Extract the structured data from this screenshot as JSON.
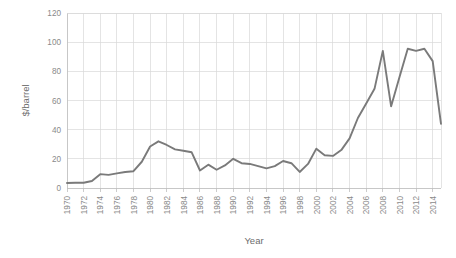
{
  "chart_data": {
    "type": "line",
    "title": "",
    "xlabel": "Year",
    "ylabel": "$/barrel",
    "xlim": [
      1970,
      2015
    ],
    "ylim": [
      0,
      120
    ],
    "grid": true,
    "legend": "none",
    "line_color": "#7a7a7a",
    "grid_color": "#d9d9d9",
    "axis_color": "#bfbfbf",
    "text_color": "#8a8a8a",
    "ytick_labels": [
      "0",
      "20",
      "40",
      "60",
      "80",
      "100",
      "120"
    ],
    "ytick_values": [
      0,
      20,
      40,
      60,
      80,
      100,
      120
    ],
    "xtick_labels": [
      "1970",
      "1972",
      "1974",
      "1976",
      "1978",
      "1980",
      "1982",
      "1984",
      "1986",
      "1988",
      "1990",
      "1992",
      "1994",
      "1996",
      "1998",
      "2000",
      "2002",
      "2004",
      "2006",
      "2008",
      "2010",
      "2012",
      "2014"
    ],
    "xtick_values": [
      1970,
      1972,
      1974,
      1976,
      1978,
      1980,
      1982,
      1984,
      1986,
      1988,
      1990,
      1992,
      1994,
      1996,
      1998,
      2000,
      2002,
      2004,
      2006,
      2008,
      2010,
      2012,
      2014
    ],
    "series": [
      {
        "name": "Crude oil price",
        "x": [
          1970,
          1971,
          1972,
          1973,
          1974,
          1975,
          1976,
          1977,
          1978,
          1979,
          1980,
          1981,
          1982,
          1983,
          1984,
          1985,
          1986,
          1987,
          1988,
          1989,
          1990,
          1991,
          1992,
          1993,
          1994,
          1995,
          1996,
          1997,
          1998,
          1999,
          2000,
          2001,
          2002,
          2003,
          2004,
          2005,
          2006,
          2007,
          2008,
          2009,
          2010,
          2011,
          2012,
          2013,
          2014,
          2015
        ],
        "values": [
          3.4,
          3.6,
          3.6,
          4.8,
          9.5,
          9.0,
          10.0,
          11.0,
          11.5,
          18.0,
          28.5,
          32.0,
          29.5,
          26.5,
          25.5,
          24.5,
          12.0,
          16.0,
          12.5,
          15.5,
          20.0,
          17.0,
          16.5,
          15.0,
          13.5,
          15.0,
          18.5,
          17.0,
          11.0,
          16.5,
          27.0,
          22.5,
          22.0,
          26.0,
          34.0,
          48.0,
          58.0,
          68.0,
          94.0,
          56.0,
          76.0,
          95.5,
          94.0,
          95.5,
          87.0,
          44.0
        ]
      }
    ]
  }
}
